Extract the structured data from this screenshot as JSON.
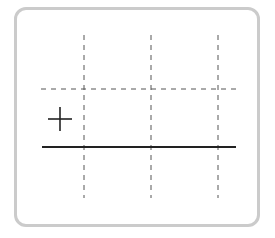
{
  "diagram": {
    "frame": {
      "border_color": "#cbcbcb",
      "background": "#ffffff"
    },
    "grid": {
      "color": "#555555",
      "dash": "5,5",
      "vertical_lines_x": [
        84,
        151,
        218
      ],
      "vertical_y_range": [
        35,
        198
      ],
      "horizontal_lines_y": [
        89
      ],
      "horizontal_x_range": [
        41,
        236
      ]
    },
    "baseline": {
      "y": 147,
      "x_range": [
        42,
        236
      ],
      "color": "#222222"
    },
    "marker": {
      "symbol": "+",
      "cx": 60,
      "cy": 119,
      "arm": 12,
      "color": "#222222",
      "icon": "plus-icon"
    }
  }
}
